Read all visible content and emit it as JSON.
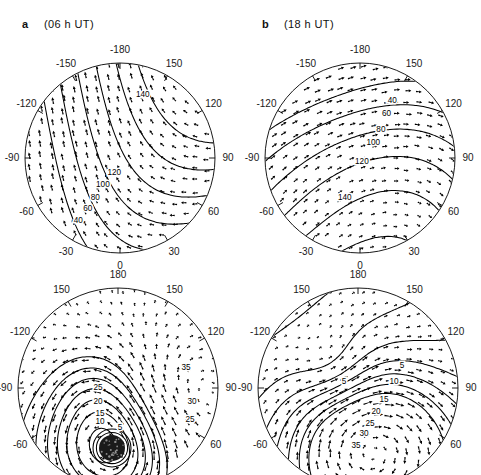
{
  "figure": {
    "type": "polar-vector-contour-grid",
    "rows": 2,
    "cols": 2,
    "background": "#ffffff",
    "line_color": "#000000"
  },
  "panels": [
    {
      "id": "a",
      "label": "a",
      "time": "(06 h UT)",
      "position": "top-left",
      "projection": "polar",
      "longitude_ticks": [
        "-180",
        "-150",
        "-120",
        "-90",
        "-60",
        "-30",
        "0",
        "30",
        "60",
        "90",
        "120",
        "150"
      ],
      "contour_labels": [
        "140",
        "120",
        "100",
        "80",
        "60",
        "40"
      ],
      "contour_interval": 20,
      "has_shaded_core": false
    },
    {
      "id": "b",
      "label": "b",
      "time": "(18 h UT)",
      "position": "top-right",
      "projection": "polar",
      "longitude_ticks": [
        "-180",
        "-150",
        "-120",
        "-90",
        "-60",
        "-30",
        "0",
        "30",
        "60",
        "90",
        "120",
        "150"
      ],
      "contour_labels": [
        "40",
        "60",
        "80",
        "100",
        "120",
        "140"
      ],
      "contour_interval": 20,
      "has_shaded_core": false
    },
    {
      "id": "c",
      "label": "",
      "time": "",
      "position": "bottom-left",
      "projection": "polar",
      "longitude_ticks": [
        "180",
        "150",
        "-120",
        "-90",
        "-60",
        "60",
        "90",
        "120",
        "150"
      ],
      "contour_labels": [
        "35",
        "30",
        "25",
        "20",
        "15",
        "10",
        "5"
      ],
      "contour_interval": 5,
      "has_shaded_core": true
    },
    {
      "id": "d",
      "label": "",
      "time": "",
      "position": "bottom-right",
      "projection": "polar",
      "longitude_ticks": [
        "180",
        "150",
        "-120",
        "-90",
        "-60",
        "60",
        "90",
        "120",
        "150"
      ],
      "contour_labels": [
        "5",
        "10",
        "15",
        "20",
        "25",
        "30",
        "35"
      ],
      "contour_interval": 5,
      "has_shaded_core": false
    }
  ],
  "chart_data": {
    "type": "scatter",
    "title": "",
    "xlabel": "",
    "ylabel": "",
    "panels": [
      {
        "name": "a (06 h UT)",
        "contour_levels": [
          40,
          60,
          80,
          100,
          120,
          140
        ],
        "labeled_contours": [
          {
            "value": "140",
            "x": 0.62,
            "y": 0.17
          },
          {
            "value": "120",
            "x": 0.47,
            "y": 0.58
          },
          {
            "value": "100",
            "x": 0.41,
            "y": 0.64
          },
          {
            "value": "80",
            "x": 0.37,
            "y": 0.71
          },
          {
            "value": "60",
            "x": 0.33,
            "y": 0.77
          },
          {
            "value": "40",
            "x": 0.28,
            "y": 0.83
          }
        ],
        "lon_ticks": [
          {
            "label": "-180",
            "angle": 90
          },
          {
            "label": "-150",
            "angle": 120
          },
          {
            "label": "-120",
            "angle": 150
          },
          {
            "label": "-90",
            "angle": 180
          },
          {
            "label": "-60",
            "angle": 210
          },
          {
            "label": "-30",
            "angle": 240
          },
          {
            "label": "0",
            "angle": 270
          },
          {
            "label": "30",
            "angle": 300
          },
          {
            "label": "60",
            "angle": 330
          },
          {
            "label": "90",
            "angle": 0
          },
          {
            "label": "120",
            "angle": 30
          },
          {
            "label": "150",
            "angle": 60
          }
        ]
      },
      {
        "name": "b (18 h UT)",
        "contour_levels": [
          40,
          60,
          80,
          100,
          120,
          140
        ],
        "labeled_contours": [
          {
            "value": "40",
            "x": 0.67,
            "y": 0.2
          },
          {
            "value": "60",
            "x": 0.64,
            "y": 0.27
          },
          {
            "value": "80",
            "x": 0.61,
            "y": 0.35
          },
          {
            "value": "100",
            "x": 0.57,
            "y": 0.42
          },
          {
            "value": "120",
            "x": 0.51,
            "y": 0.52
          },
          {
            "value": "140",
            "x": 0.42,
            "y": 0.71
          }
        ],
        "lon_ticks": [
          {
            "label": "-180",
            "angle": 90
          },
          {
            "label": "-150",
            "angle": 120
          },
          {
            "label": "-120",
            "angle": 150
          },
          {
            "label": "-90",
            "angle": 180
          },
          {
            "label": "-60",
            "angle": 210
          },
          {
            "label": "-30",
            "angle": 240
          },
          {
            "label": "0",
            "angle": 270
          },
          {
            "label": "30",
            "angle": 300
          },
          {
            "label": "60",
            "angle": 330
          },
          {
            "label": "90",
            "angle": 0
          },
          {
            "label": "120",
            "angle": 30
          },
          {
            "label": "150",
            "angle": 60
          }
        ]
      },
      {
        "name": "bottom-left",
        "contour_levels": [
          5,
          10,
          15,
          20,
          25,
          30,
          35
        ],
        "labeled_contours": [
          {
            "value": "35",
            "x": 0.84,
            "y": 0.4
          },
          {
            "value": "30",
            "x": 0.87,
            "y": 0.57
          },
          {
            "value": "25",
            "x": 0.86,
            "y": 0.66
          },
          {
            "value": "25",
            "x": 0.4,
            "y": 0.5
          },
          {
            "value": "20",
            "x": 0.4,
            "y": 0.57
          },
          {
            "value": "15",
            "x": 0.41,
            "y": 0.63
          },
          {
            "value": "10",
            "x": 0.41,
            "y": 0.67
          },
          {
            "value": "5",
            "x": 0.51,
            "y": 0.7
          }
        ],
        "lon_ticks": [
          {
            "label": "180",
            "angle": 90
          },
          {
            "label": "150",
            "angle": 120
          },
          {
            "label": "-120",
            "angle": 150
          },
          {
            "label": "-90",
            "angle": 180
          },
          {
            "label": "-60",
            "angle": 210
          },
          {
            "label": "60",
            "angle": 330
          },
          {
            "label": "90",
            "angle": 0
          },
          {
            "label": "120",
            "angle": 30
          },
          {
            "label": "150",
            "angle": 60
          }
        ],
        "shaded_core": {
          "x": 0.47,
          "y": 0.8,
          "radius": 0.13,
          "fill": "#1a1a1a"
        }
      },
      {
        "name": "bottom-right",
        "contour_levels": [
          5,
          10,
          15,
          20,
          25,
          30,
          35
        ],
        "labeled_contours": [
          {
            "value": "5",
            "x": 0.72,
            "y": 0.39
          },
          {
            "value": "10",
            "x": 0.68,
            "y": 0.47
          },
          {
            "value": "15",
            "x": 0.63,
            "y": 0.56
          },
          {
            "value": "20",
            "x": 0.59,
            "y": 0.62
          },
          {
            "value": "25",
            "x": 0.56,
            "y": 0.68
          },
          {
            "value": "30",
            "x": 0.53,
            "y": 0.73
          },
          {
            "value": "35",
            "x": 0.49,
            "y": 0.79
          },
          {
            "value": "5",
            "x": 0.43,
            "y": 0.47
          }
        ],
        "lon_ticks": [
          {
            "label": "180",
            "angle": 90
          },
          {
            "label": "150",
            "angle": 120
          },
          {
            "label": "-120",
            "angle": 150
          },
          {
            "label": "-90",
            "angle": 180
          },
          {
            "label": "-60",
            "angle": 210
          },
          {
            "label": "60",
            "angle": 330
          },
          {
            "label": "90",
            "angle": 0
          },
          {
            "label": "120",
            "angle": 30
          },
          {
            "label": "150",
            "angle": 60
          }
        ]
      }
    ]
  }
}
